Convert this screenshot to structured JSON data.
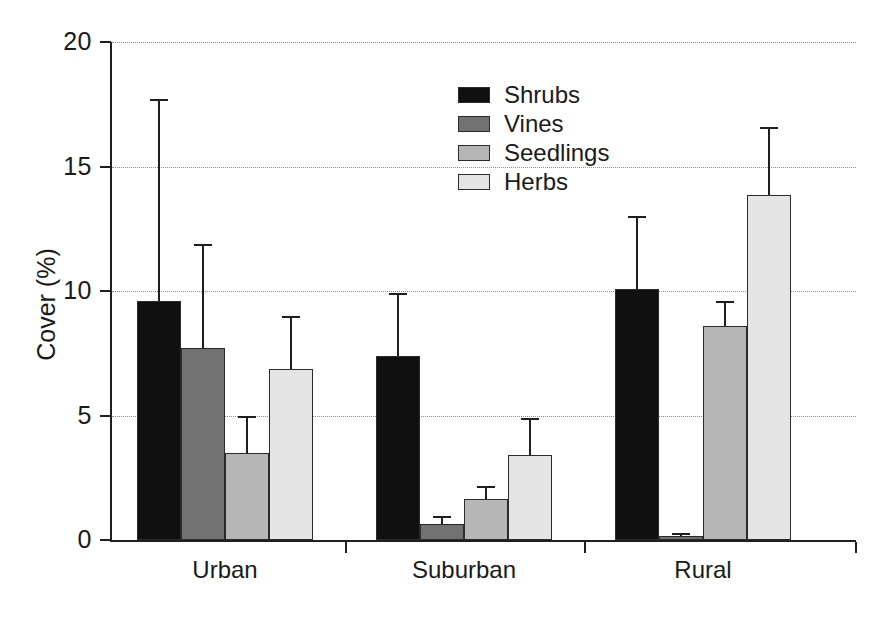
{
  "chart_data": {
    "type": "bar",
    "title": "",
    "subtitle": "",
    "xlabel": "",
    "ylabel": "Cover (%)",
    "categories": [
      "Urban",
      "Suburban",
      "Rural"
    ],
    "ylim": [
      0,
      20
    ],
    "yticks": [
      0,
      5,
      10,
      15,
      20
    ],
    "ytick_labels": [
      "0",
      "5",
      "10",
      "15",
      "20"
    ],
    "grid": "horizontal dotted gridlines at 5, 10, 15, 20",
    "legend_position": "upper center",
    "error_bars": "upper standard error / standard deviation whiskers",
    "series": [
      {
        "name": "Shrubs",
        "color": "#101010",
        "values": [
          9.6,
          7.4,
          10.1
        ],
        "errors_upper": [
          17.7,
          9.9,
          13.0
        ]
      },
      {
        "name": "Vines",
        "color": "#727272",
        "values": [
          7.7,
          0.65,
          0.15
        ],
        "errors_upper": [
          11.9,
          0.95,
          0.3
        ]
      },
      {
        "name": "Seedlings",
        "color": "#b6b6b6",
        "values": [
          3.5,
          1.65,
          8.6
        ],
        "errors_upper": [
          5.0,
          2.15,
          9.6
        ]
      },
      {
        "name": "Herbs",
        "color": "#e4e4e4",
        "values": [
          6.85,
          3.4,
          13.85
        ],
        "errors_upper": [
          9.0,
          4.9,
          16.6
        ]
      }
    ]
  },
  "axis": {
    "y_title": "Cover (%)"
  },
  "colors": {
    "shrubs": "#101010",
    "vines": "#727272",
    "seedlings": "#b6b6b6",
    "herbs": "#e4e4e4",
    "axis": "#1f1f1f",
    "grid": "#8f8f8f",
    "background": "#ffffff"
  }
}
